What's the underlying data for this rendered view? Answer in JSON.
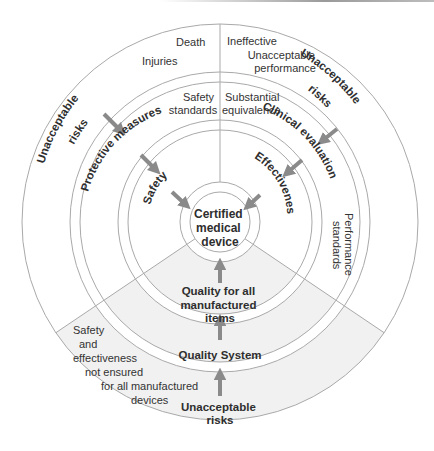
{
  "colors": {
    "ring_stroke": "#a9a9a9",
    "arrow": "#8a8a8a",
    "lower_sector_fill": "#f1f1f1",
    "text": "#333333"
  },
  "center": {
    "lines": [
      "Certified",
      "medical",
      "device"
    ]
  },
  "sectors": {
    "safety": {
      "outer_labels": [
        "Death",
        "Injuries"
      ],
      "outer_risk": [
        "Unacceptable",
        "risks"
      ],
      "standards": [
        "Safety",
        "standards"
      ],
      "measures": "Protective measures",
      "result": "Safety"
    },
    "effectiveness": {
      "outer_labels": [
        "Ineffective",
        "Unacceptable",
        "performance"
      ],
      "outer_risk": [
        "Unacceptable",
        "risks"
      ],
      "standards": [
        "Substantial",
        "equivalence"
      ],
      "measures": "Clinical evaluation",
      "result": "Effectiveness",
      "performance_standards": [
        "Performance",
        "standards"
      ]
    },
    "quality": {
      "outer_label": [
        "Safety",
        "and",
        "effectiveness",
        "not ensured",
        "for all manufactured",
        "devices"
      ],
      "outer_risk": [
        "Unacceptable",
        "risks"
      ],
      "system": "Quality System",
      "result": [
        "Quality for all",
        "manufactured",
        "items"
      ]
    }
  }
}
